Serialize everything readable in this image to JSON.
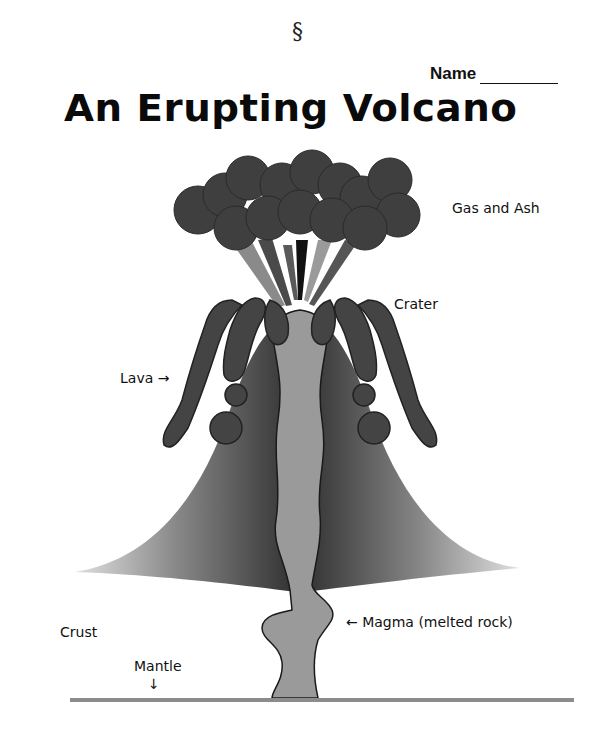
{
  "header": {
    "section_symbol": "§",
    "name_label": "Name",
    "title": "An Erupting Volcano"
  },
  "labels": {
    "gas_and_ash": "Gas and Ash",
    "crater": "Crater",
    "lava": "Lava →",
    "magma": "← Magma (melted rock)",
    "crust": "Crust",
    "mantle": "Mantle",
    "mantle_arrow": "↓"
  },
  "colors": {
    "ash_cloud": "#3f3f3f",
    "lava": "#444444",
    "magma": "#9a9a9a",
    "cone_dark": "#3a3a3a",
    "cone_light": "#d8d8d8",
    "ground_line": "#8c8c8c"
  }
}
